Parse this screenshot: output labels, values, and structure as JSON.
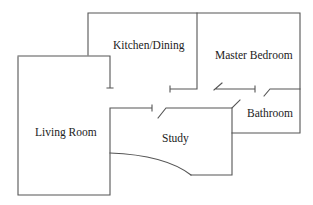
{
  "diagram": {
    "type": "floor-plan",
    "rooms": [
      {
        "id": "kitchen",
        "label": "Kitchen/Dining",
        "x": 113,
        "y": 49
      },
      {
        "id": "master",
        "label": "Master Bedroom",
        "x": 215,
        "y": 59
      },
      {
        "id": "bathroom",
        "label": "Bathroom",
        "x": 247,
        "y": 117
      },
      {
        "id": "living",
        "label": "Living Room",
        "x": 35,
        "y": 136
      },
      {
        "id": "study",
        "label": "Study",
        "x": 162,
        "y": 142
      }
    ],
    "colors": {
      "wall": "#555555",
      "text": "#222222",
      "background": "#ffffff"
    }
  }
}
